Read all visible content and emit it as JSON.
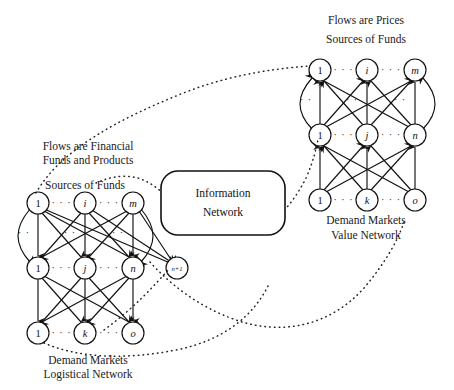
{
  "figure": {
    "background": "#ffffff",
    "ink": "#111111"
  },
  "center_box": {
    "name": "Information Network",
    "line1": "Information",
    "line2": "Network"
  },
  "left_network": {
    "heading_line1": "Flows are Financial",
    "heading_line2": "Funds and Products",
    "tier_top_label": "Sources of Funds",
    "caption_line1": "Demand Markets",
    "caption_line2": "Logistical Network",
    "flow_direction": "down",
    "rows": [
      {
        "row_name": "sources-of-funds",
        "nodes": [
          {
            "label": "1",
            "italic": false
          },
          {
            "label": "i",
            "italic": true
          },
          {
            "label": "m",
            "italic": true
          }
        ],
        "ellipses": [
          "· · ·",
          "· · ·"
        ]
      },
      {
        "row_name": "intermediaries",
        "nodes": [
          {
            "label": "1",
            "italic": false
          },
          {
            "label": "j",
            "italic": true
          },
          {
            "label": "n",
            "italic": true
          }
        ],
        "ellipses": [
          "· · ·",
          "· · ·"
        ],
        "extra_node": {
          "label": "n+1",
          "italic": true
        }
      },
      {
        "row_name": "demand-markets",
        "nodes": [
          {
            "label": "1",
            "italic": false
          },
          {
            "label": "k",
            "italic": true
          },
          {
            "label": "o",
            "italic": true
          }
        ],
        "ellipses": [
          "· · ·",
          "· · ·"
        ]
      }
    ]
  },
  "right_network": {
    "heading_line1": "Flows are Prices",
    "heading_line2": "Sources of Funds",
    "caption_line1": "Demand Markets",
    "caption_line2": "Value Network",
    "flow_direction": "up",
    "rows": [
      {
        "row_name": "sources-of-funds",
        "nodes": [
          {
            "label": "1",
            "italic": false
          },
          {
            "label": "i",
            "italic": true
          },
          {
            "label": "m",
            "italic": true
          }
        ],
        "ellipses": [
          "· · ·",
          "· · ·"
        ]
      },
      {
        "row_name": "intermediaries",
        "nodes": [
          {
            "label": "1",
            "italic": false
          },
          {
            "label": "j",
            "italic": true
          },
          {
            "label": "n",
            "italic": true
          }
        ],
        "ellipses": [
          "· · ·",
          "· · ·"
        ]
      },
      {
        "row_name": "demand-markets",
        "nodes": [
          {
            "label": "1",
            "italic": false
          },
          {
            "label": "k",
            "italic": true
          },
          {
            "label": "o",
            "italic": true
          }
        ],
        "ellipses": [
          "· · ·",
          "· · ·"
        ]
      }
    ]
  },
  "side_ellipses": {
    "left_top": "· ·",
    "left_mid": "· ·",
    "right_top": "· ·",
    "right_mid": "· ·"
  }
}
